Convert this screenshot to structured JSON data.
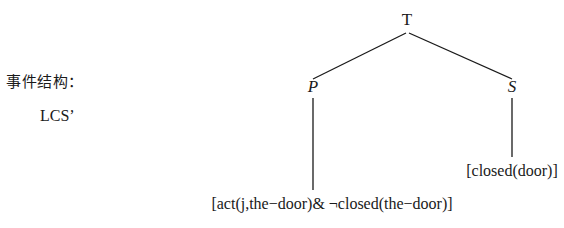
{
  "figure": {
    "background_color": "#ffffff",
    "ink_color": "#1a1a1a"
  },
  "annotations": {
    "event_structure_label": "事件结构：",
    "lcs_label": "LCS’"
  },
  "tree": {
    "root": {
      "label": "T"
    },
    "branches": [
      {
        "label": "P"
      },
      {
        "label": "S"
      }
    ],
    "leaves": [
      {
        "label": "[act(j,the−door)& ¬closed(the−door)]"
      },
      {
        "label": "[closed(door)]"
      }
    ]
  }
}
